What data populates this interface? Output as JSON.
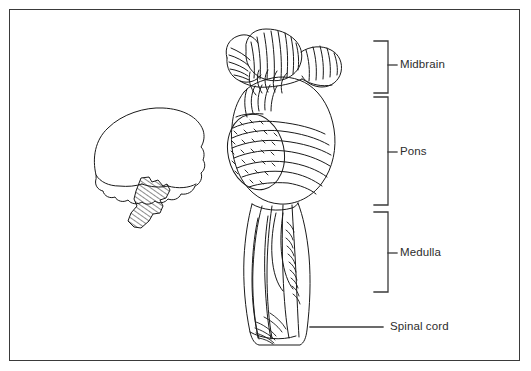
{
  "figure": {
    "background_color": "#ffffff",
    "frame_color": "#3a3a3a",
    "ink_color": "#1a1a1a",
    "text_color": "#2d2d2d"
  },
  "labels": {
    "midbrain": "Midbrain",
    "pons": "Pons",
    "medulla": "Medulla",
    "spinal_cord": "Spinal cord"
  },
  "brackets": [
    {
      "name": "midbrain",
      "label": "Midbrain",
      "top": 41,
      "bottom": 93,
      "tick_y": 65
    },
    {
      "name": "pons",
      "label": "Pons",
      "top": 97,
      "bottom": 205,
      "tick_y": 152
    },
    {
      "name": "medulla",
      "label": "Medulla",
      "top": 212,
      "bottom": 292,
      "tick_y": 253
    }
  ],
  "leader_lines": [
    {
      "name": "spinal-cord",
      "label": "Spinal cord",
      "x1": 310,
      "x2": 383,
      "y": 327
    }
  ],
  "inset": {
    "name": "brain-orientation-key",
    "description": "Small lateral brain silhouette with brainstem shaded by diagonal hatching"
  }
}
